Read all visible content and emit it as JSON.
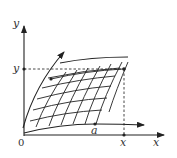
{
  "diagram": {
    "axes": {
      "x_label": "x",
      "y_label": "y",
      "origin_label": "0"
    },
    "point_labels": {
      "x_tick": "x",
      "y_tick": "y",
      "a_point": "a"
    },
    "colors": {
      "stroke": "#222222",
      "background": "#ffffff"
    }
  }
}
